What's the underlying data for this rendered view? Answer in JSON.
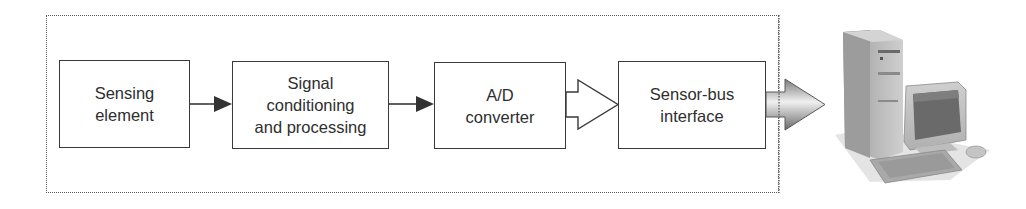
{
  "diagram": {
    "title": "",
    "frame": {
      "style": "dotted",
      "label": ""
    },
    "blocks": [
      {
        "id": "sensing",
        "lines": [
          "Sensing",
          "element"
        ]
      },
      {
        "id": "signal",
        "lines": [
          "Signal",
          "conditioning",
          "and processing"
        ]
      },
      {
        "id": "adc",
        "lines": [
          "A/D",
          "converter"
        ]
      },
      {
        "id": "bus",
        "lines": [
          "Sensor-bus",
          "interface"
        ]
      }
    ],
    "connections": [
      {
        "from": "sensing",
        "to": "signal",
        "style": "solid-arrow"
      },
      {
        "from": "signal",
        "to": "adc",
        "style": "solid-arrow"
      },
      {
        "from": "adc",
        "to": "bus",
        "style": "hollow-wide-arrow"
      },
      {
        "from": "bus",
        "to": "computer",
        "style": "shaded-wide-arrow"
      }
    ],
    "computer": {
      "icon": "desktop-computer-icon",
      "parts": [
        "tower",
        "monitor",
        "keyboard",
        "mouse"
      ]
    }
  },
  "colors": {
    "line": "#3a3a3a",
    "text": "#2e2e2e",
    "frame": "#5a5a5a",
    "arrow_shade_dark": "#6e6e6e",
    "arrow_shade_light": "#e8e8e8"
  }
}
